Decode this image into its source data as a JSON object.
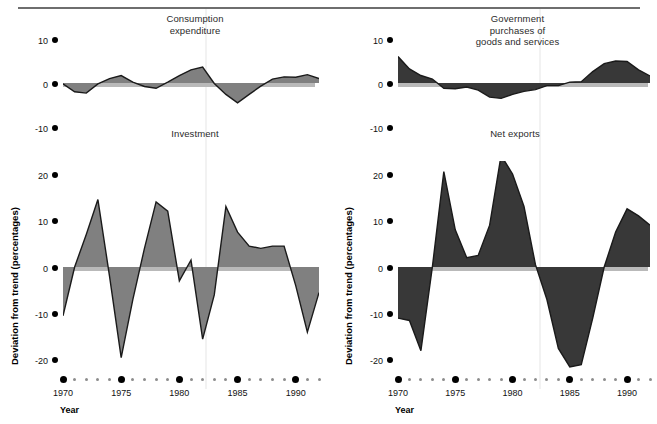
{
  "figure": {
    "yaxis_title": "Deviation from trend (percentages)",
    "xaxis_title": "Year",
    "colors": {
      "fill_light": "#808080",
      "fill_dark": "#383838",
      "outline": "#1a1a1a",
      "baseline": "#b9b9b9",
      "tick_dot": "#000000",
      "minor_dot": "#8c8c8c",
      "rule": "#6e6e6e"
    }
  },
  "panels": [
    {
      "id": "consumption-expenditure",
      "title": "Consumption\nexpenditure",
      "ytick_labels": [
        "10",
        "0",
        "-10"
      ]
    },
    {
      "id": "government-purchases",
      "title": "Government\npurchases of\ngoods and services",
      "ytick_labels": [
        "10",
        "0",
        "-10"
      ]
    },
    {
      "id": "investment",
      "title": "Investment",
      "ytick_labels": [
        "20",
        "10",
        "0",
        "-10",
        "-20"
      ]
    },
    {
      "id": "net-exports",
      "title": "Net exports",
      "ytick_labels": [
        "20",
        "10",
        "0",
        "-10",
        "-20"
      ]
    }
  ],
  "xaxis": {
    "major_labels": [
      "1970",
      "1975",
      "1980",
      "1985",
      "1990"
    ],
    "major_years": [
      1970,
      1975,
      1980,
      1985,
      1990
    ],
    "start_year": 1970,
    "end_year": 1992
  },
  "chart_data": [
    {
      "type": "area",
      "id": "consumption-expenditure",
      "title": "Consumption expenditure",
      "xlabel": "Year",
      "ylabel": "Deviation from trend (percentages)",
      "ylim": [
        -10,
        10
      ],
      "yticks": [
        -10,
        0,
        10
      ],
      "xlim": [
        1970,
        1992
      ],
      "xticks": [
        1970,
        1975,
        1980,
        1985,
        1990
      ],
      "grid": false,
      "legend": "none",
      "fill_color": "#808080",
      "x": [
        1970,
        1971,
        1972,
        1973,
        1974,
        1975,
        1976,
        1977,
        1978,
        1979,
        1980,
        1981,
        1982,
        1983,
        1984,
        1985,
        1986,
        1987,
        1988,
        1989,
        1990,
        1991,
        1992
      ],
      "values": [
        -0.2,
        -2.0,
        -2.3,
        -0.2,
        1.0,
        1.7,
        0.2,
        -0.8,
        -1.2,
        0.2,
        1.7,
        3.0,
        3.6,
        -0.1,
        -2.6,
        -4.5,
        -2.6,
        -0.7,
        0.9,
        1.4,
        1.3,
        1.9,
        1.0
      ]
    },
    {
      "type": "area",
      "id": "government-purchases",
      "title": "Government purchases of goods and services",
      "xlabel": "Year",
      "ylabel": "Deviation from trend (percentages)",
      "ylim": [
        -10,
        10
      ],
      "yticks": [
        -10,
        0,
        10
      ],
      "xlim": [
        1970,
        1992
      ],
      "xticks": [
        1970,
        1975,
        1980,
        1985,
        1990
      ],
      "grid": false,
      "legend": "none",
      "fill_color": "#383838",
      "x": [
        1970,
        1971,
        1972,
        1973,
        1974,
        1975,
        1976,
        1977,
        1978,
        1979,
        1980,
        1981,
        1982,
        1983,
        1984,
        1985,
        1986,
        1987,
        1988,
        1989,
        1990,
        1991,
        1992
      ],
      "values": [
        6.0,
        3.2,
        1.7,
        0.9,
        -1.2,
        -1.3,
        -0.9,
        -1.6,
        -3.2,
        -3.5,
        -2.6,
        -1.9,
        -1.5,
        -0.6,
        -0.6,
        0.2,
        0.3,
        2.6,
        4.4,
        5.0,
        4.9,
        3.0,
        1.6
      ]
    },
    {
      "type": "area",
      "id": "investment",
      "title": "Investment",
      "xlabel": "Year",
      "ylabel": "Deviation from trend (percentages)",
      "ylim": [
        -22,
        22
      ],
      "yticks": [
        -20,
        -10,
        0,
        10,
        20
      ],
      "xlim": [
        1970,
        1992
      ],
      "xticks": [
        1970,
        1975,
        1980,
        1985,
        1990
      ],
      "grid": false,
      "legend": "none",
      "fill_color": "#808080",
      "x": [
        1970,
        1971,
        1972,
        1973,
        1974,
        1975,
        1976,
        1977,
        1978,
        1979,
        1980,
        1981,
        1982,
        1983,
        1984,
        1985,
        1986,
        1987,
        1988,
        1989,
        1990,
        1991,
        1992
      ],
      "values": [
        -10.5,
        0.0,
        7.0,
        14.5,
        -2.0,
        -19.5,
        -7.0,
        4.0,
        14.0,
        12.0,
        -3.0,
        1.5,
        -15.5,
        -6.0,
        13.0,
        7.5,
        4.5,
        4.0,
        4.5,
        4.5,
        -4.0,
        -14.0,
        -5.5
      ]
    },
    {
      "type": "area",
      "id": "net-exports",
      "title": "Net exports",
      "xlabel": "Year",
      "ylabel": "Deviation from trend (percentages)",
      "ylim": [
        -24,
        25
      ],
      "yticks": [
        -20,
        -10,
        0,
        10,
        20
      ],
      "xlim": [
        1970,
        1992
      ],
      "xticks": [
        1970,
        1975,
        1980,
        1985,
        1990
      ],
      "grid": false,
      "legend": "none",
      "fill_color": "#383838",
      "x": [
        1970,
        1971,
        1972,
        1973,
        1974,
        1975,
        1976,
        1977,
        1978,
        1979,
        1980,
        1981,
        1982,
        1983,
        1984,
        1985,
        1986,
        1987,
        1988,
        1989,
        1990,
        1991,
        1992
      ],
      "values": [
        -11.0,
        -11.5,
        -18.0,
        0.0,
        20.5,
        8.0,
        2.0,
        2.5,
        9.0,
        24.0,
        20.0,
        13.0,
        0.5,
        -7.0,
        -17.5,
        -21.5,
        -21.0,
        -11.0,
        0.0,
        7.5,
        12.5,
        11.0,
        9.0
      ]
    }
  ]
}
